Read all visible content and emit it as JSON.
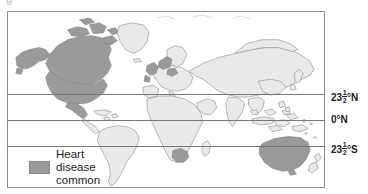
{
  "figure": {
    "caption_remnant": "g",
    "type": "world-map-thematic"
  },
  "map": {
    "title": "World map showing where heart disease is common",
    "ocean_color": "#ffffff",
    "land_color": "#e9e9e9",
    "land_outline_color": "#9a9a9a",
    "highlight_color": "#9a9a9a",
    "frame_color": "#8d8d8d",
    "latitude_line_color": "#77777a"
  },
  "latitudes": [
    {
      "id": "tropic-of-cancer",
      "whole": "23",
      "numerator": "1",
      "denominator": "2",
      "suffix": "°N",
      "label": "23½°N"
    },
    {
      "id": "equator",
      "whole": "",
      "numerator": "",
      "denominator": "",
      "suffix": "",
      "label": "0°N"
    },
    {
      "id": "tropic-of-capricorn",
      "whole": "23",
      "numerator": "1",
      "denominator": "2",
      "suffix": "°S",
      "label": "23½°S"
    }
  ],
  "legend": {
    "swatch_color": "#9a9a9a",
    "line1": "Heart",
    "line2": "disease",
    "line3": "common"
  },
  "shaded_regions": [
    "North America",
    "United Kingdom and Northern Europe",
    "Australia",
    "Southern Africa"
  ]
}
